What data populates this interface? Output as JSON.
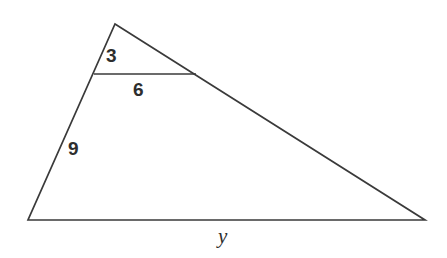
{
  "figure": {
    "type": "geometry-diagram",
    "shape": "triangle-with-parallel-cevian",
    "background_color": "#ffffff",
    "stroke_color": "#3a3a3a",
    "label_color": "#2e2e2e"
  },
  "labels": {
    "upper_left_segment": "3",
    "cevian_segment": "6",
    "lower_left_segment": "9",
    "base_segment": "y"
  },
  "geometry": {
    "apex": {
      "x": 115,
      "y": 24
    },
    "bottom_left": {
      "x": 28,
      "y": 220
    },
    "bottom_right": {
      "x": 425,
      "y": 220
    },
    "cevian_left": {
      "x": 94,
      "y": 74
    },
    "cevian_right": {
      "x": 196,
      "y": 74
    }
  }
}
